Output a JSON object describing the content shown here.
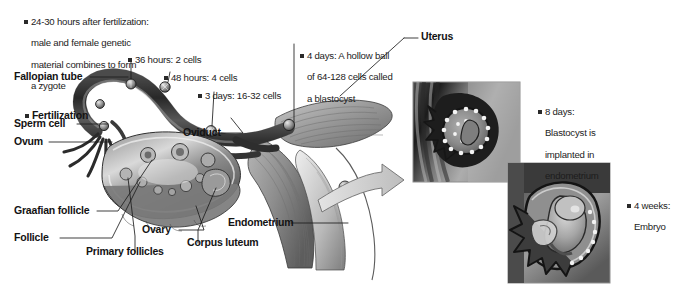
{
  "figure": {
    "background_color": "#ffffff",
    "ink_color": "#1a1a1a"
  },
  "stage_annotations": [
    {
      "id": "zygote",
      "bullet": true,
      "lines": [
        "24-30 hours after fertilization:",
        "male and female genetic",
        "material combines to form",
        "a zygote"
      ]
    },
    {
      "id": "two-cells",
      "bullet": true,
      "lines": [
        "36 hours: 2 cells"
      ]
    },
    {
      "id": "four-cells",
      "bullet": true,
      "lines": [
        "48 hours: 4 cells"
      ]
    },
    {
      "id": "sixteen-thirtytwo-cells",
      "bullet": true,
      "lines": [
        "3 days: 16-32 cells"
      ]
    },
    {
      "id": "blastocyst",
      "bullet": true,
      "lines": [
        "4 days: A hollow ball",
        "of 64-128 cells called",
        "a blastocyst"
      ]
    },
    {
      "id": "implantation",
      "bullet": true,
      "lines": [
        "8 days:",
        "Blastocyst is",
        "implanted in",
        "endometrium"
      ]
    },
    {
      "id": "embryo",
      "bullet": true,
      "lines": [
        "4 weeks:",
        "Embryo"
      ]
    }
  ],
  "anatomy_labels": [
    {
      "id": "fallopian-tube",
      "text": "Fallopian tube"
    },
    {
      "id": "fertilization",
      "text": "Fertilization",
      "bullet": true
    },
    {
      "id": "sperm-cell",
      "text": "Sperm cell"
    },
    {
      "id": "ovum",
      "text": "Ovum"
    },
    {
      "id": "oviduct",
      "text": "Oviduct"
    },
    {
      "id": "graafian-follicle",
      "text": "Graafian follicle"
    },
    {
      "id": "follicle",
      "text": "Follicle"
    },
    {
      "id": "primary-follicles",
      "text": "Primary follicles"
    },
    {
      "id": "ovary",
      "text": "Ovary"
    },
    {
      "id": "corpus-luteum",
      "text": "Corpus luteum"
    },
    {
      "id": "endometrium",
      "text": "Endometrium"
    },
    {
      "id": "uterus",
      "text": "Uterus"
    }
  ],
  "inset_photos": [
    {
      "id": "implantation-photo",
      "caption": "Blastocyst implanted in endometrium (micrograph)"
    },
    {
      "id": "embryo-photo",
      "caption": "Four-week embryo in uterus (micrograph)"
    }
  ]
}
